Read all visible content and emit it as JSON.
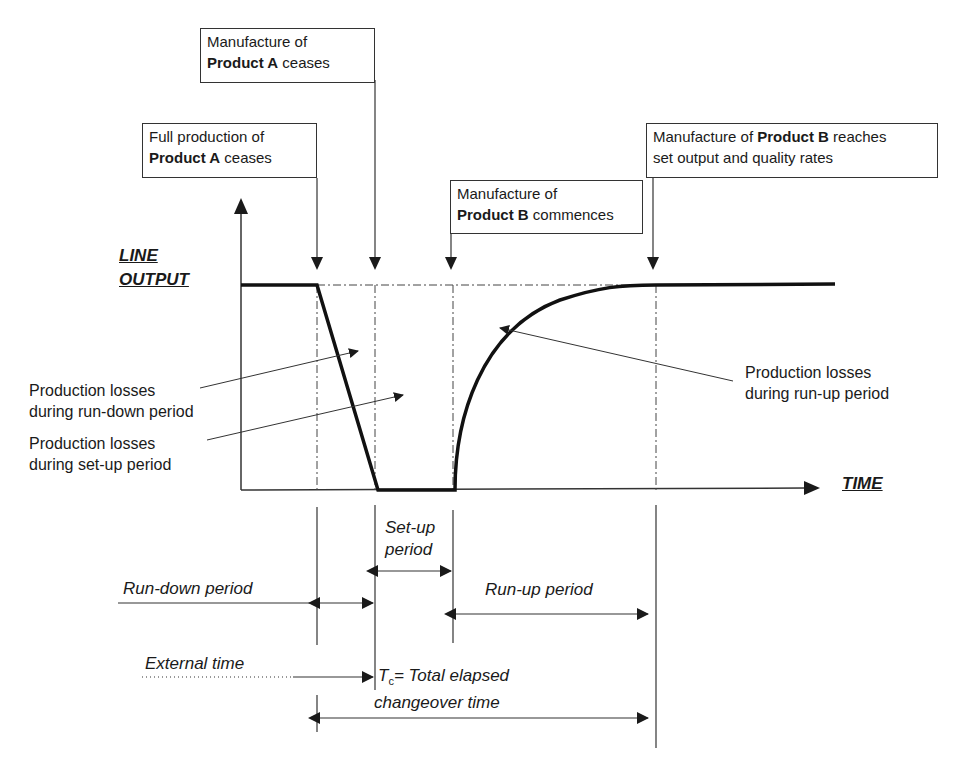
{
  "diagram": {
    "axes": {
      "y_label_line1": "LINE",
      "y_label_line2": "OUTPUT",
      "x_label": "TIME"
    },
    "event_boxes": [
      {
        "id": "full-production-a-ceases",
        "line1": "Full production of",
        "bold": "Product A",
        "rest": " ceases"
      },
      {
        "id": "manufacture-a-ceases",
        "line1": "Manufacture of",
        "bold": "Product A",
        "rest": " ceases"
      },
      {
        "id": "manufacture-b-commences",
        "line1": "Manufacture of",
        "bold": "Product B",
        "rest": " commences"
      },
      {
        "id": "product-b-reaches-rates",
        "pre": "Manufacture of ",
        "bold": "Product B",
        "post": " reaches",
        "line2": "set output and quality rates"
      }
    ],
    "loss_labels": [
      {
        "line1": "Production losses",
        "line2": "during run-down period"
      },
      {
        "line1": "Production losses",
        "line2": "during set-up period"
      },
      {
        "line1": "Production losses",
        "line2": "during run-up period"
      }
    ],
    "periods": {
      "setup_line1": "Set-up",
      "setup_line2": "period",
      "rundown": "Run-down period",
      "runup": "Run-up period",
      "external": "External time",
      "total_symbol": "T",
      "total_sub": "c",
      "total_line1": "= Total elapsed",
      "total_line2": "changeover time"
    },
    "colors": {
      "ink": "#1a1a1a",
      "background": "#ffffff"
    }
  }
}
